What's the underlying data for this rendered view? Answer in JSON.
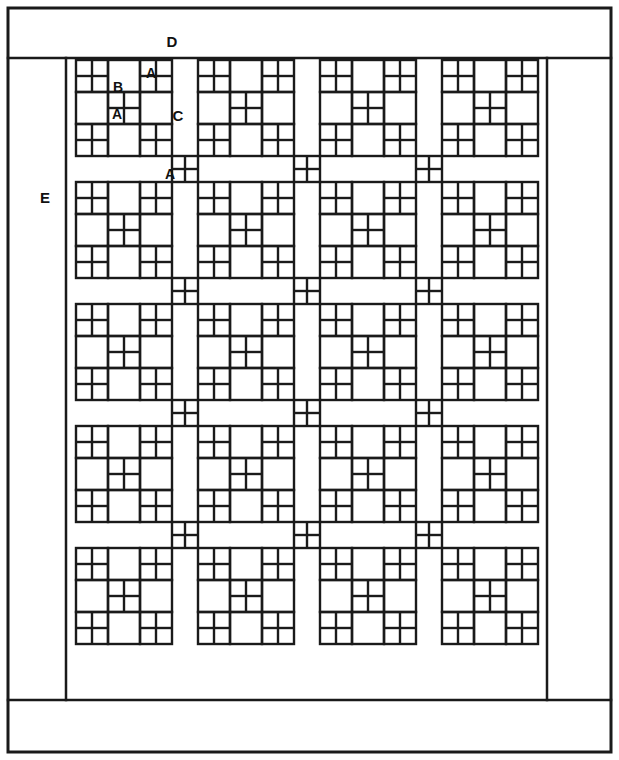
{
  "diagram": {
    "type": "quilt-piecing-schematic",
    "background_color": "#ffffff",
    "line_color": "#1a1a1a",
    "frame": {
      "outer": {
        "x": 8,
        "y": 8,
        "width": 603,
        "height": 744,
        "stroke_width": 3
      },
      "top_border_divider_y": 58,
      "bottom_border_divider_y": 700,
      "left_border_divider_x": 66,
      "right_border_divider_x": 547
    },
    "labels": [
      {
        "id": "D",
        "text": "D",
        "x": 172,
        "y": 41,
        "size": 15,
        "desc": "top-border-strip"
      },
      {
        "id": "E",
        "text": "E",
        "x": 45,
        "y": 197,
        "size": 15,
        "desc": "side-border-strip"
      },
      {
        "id": "B-top",
        "text": "B",
        "x": 118,
        "y": 87,
        "size": 14,
        "desc": "rectangle-patch"
      },
      {
        "id": "A-top",
        "text": "A",
        "x": 151,
        "y": 73,
        "size": 14,
        "desc": "small-square-patch"
      },
      {
        "id": "A-mid",
        "text": "A",
        "x": 117,
        "y": 114,
        "size": 14,
        "desc": "small-square-patch"
      },
      {
        "id": "C",
        "text": "C",
        "x": 178,
        "y": 115,
        "size": 15,
        "desc": "sashing-strip"
      },
      {
        "id": "A-sash",
        "text": "A",
        "x": 170,
        "y": 174,
        "size": 14,
        "desc": "sashing-square-patch"
      }
    ],
    "legend": {
      "A": "small square patch",
      "B": "rectangle patch",
      "C": "sashing strip",
      "D": "top border",
      "E": "side border"
    },
    "grid": {
      "block_columns": 4,
      "block_rows": 5,
      "block_size": 96,
      "sashing_width": 26,
      "origin_x": 76,
      "origin_y": 60,
      "block_structure": "3x3 nine-patch: corners and center are four-patch units (2x2 of A squares); edge units are B rectangles",
      "sashing_intersection": "four-patch of A squares"
    },
    "counts": {
      "blocks_total": 20,
      "sashing_intersections": 12
    }
  }
}
